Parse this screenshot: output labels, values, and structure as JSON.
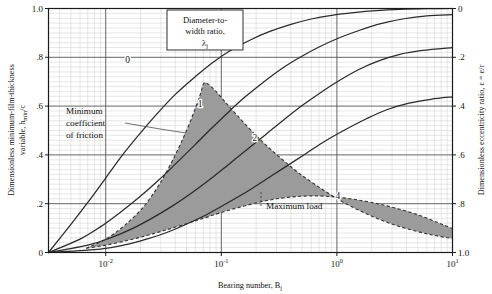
{
  "chart_data": {
    "type": "line",
    "title": "",
    "xlabel": "Bearing number, B",
    "xlabel_sub": "j",
    "ylabel_left_line1": "Dimensionless minimum-film-thickness",
    "ylabel_left_line2": "variable, h",
    "ylabel_left_sub": "min",
    "ylabel_left_tail": "/c",
    "ylabel_right": "Dimensionless eccentricity ratio, ε = e/r",
    "xscale": "log",
    "xlim": [
      0.0032,
      10
    ],
    "ylim": [
      0,
      1
    ],
    "grid": true,
    "x_tick_labels": [
      "10",
      "10",
      "10",
      "10"
    ],
    "x_tick_exponents": [
      "-2",
      "-1",
      "0",
      "1"
    ],
    "x_tick_values": [
      0.01,
      0.1,
      1,
      10
    ],
    "y_tick_labels_left": [
      "1.0",
      ".8",
      ".6",
      ".4",
      ".2",
      "0"
    ],
    "y_tick_values_left": [
      1.0,
      0.8,
      0.6,
      0.4,
      0.2,
      0.0
    ],
    "y_tick_labels_right": [
      "0",
      ".2",
      ".4",
      ".6",
      ".8",
      "1.0"
    ],
    "y_tick_values_right": [
      0.0,
      0.2,
      0.4,
      0.6,
      0.8,
      1.0
    ],
    "legend_title_line1": "Diameter-to-",
    "legend_title_line2": "width ratio,",
    "legend_title_symbol": "λ",
    "legend_title_symbol_sub": "j",
    "series": [
      {
        "name": "0",
        "label": "0",
        "label_x": 0.0155,
        "label_y": 0.775,
        "points": [
          [
            0.0032,
            0.0
          ],
          [
            0.005,
            0.115
          ],
          [
            0.007,
            0.205
          ],
          [
            0.01,
            0.305
          ],
          [
            0.014,
            0.4
          ],
          [
            0.02,
            0.49
          ],
          [
            0.028,
            0.57
          ],
          [
            0.04,
            0.648
          ],
          [
            0.06,
            0.722
          ],
          [
            0.085,
            0.78
          ],
          [
            0.12,
            0.828
          ],
          [
            0.18,
            0.872
          ],
          [
            0.26,
            0.905
          ],
          [
            0.4,
            0.935
          ],
          [
            0.6,
            0.957
          ],
          [
            0.9,
            0.972
          ],
          [
            1.4,
            0.983
          ],
          [
            2.2,
            0.991
          ],
          [
            3.5,
            0.996
          ],
          [
            6.0,
            0.999
          ],
          [
            10,
            1.0
          ]
        ]
      },
      {
        "name": "1",
        "label": "1",
        "label_x": 0.0655,
        "label_y": 0.597,
        "points": [
          [
            0.0032,
            0.0
          ],
          [
            0.006,
            0.055
          ],
          [
            0.009,
            0.105
          ],
          [
            0.013,
            0.16
          ],
          [
            0.019,
            0.222
          ],
          [
            0.028,
            0.292
          ],
          [
            0.04,
            0.362
          ],
          [
            0.058,
            0.437
          ],
          [
            0.082,
            0.508
          ],
          [
            0.115,
            0.575
          ],
          [
            0.16,
            0.637
          ],
          [
            0.23,
            0.697
          ],
          [
            0.33,
            0.752
          ],
          [
            0.48,
            0.8
          ],
          [
            0.7,
            0.842
          ],
          [
            1.05,
            0.88
          ],
          [
            1.6,
            0.912
          ],
          [
            2.4,
            0.938
          ],
          [
            3.8,
            0.958
          ],
          [
            6.0,
            0.97
          ],
          [
            10,
            0.975
          ]
        ]
      },
      {
        "name": "2",
        "label": "2",
        "label_x": 0.195,
        "label_y": 0.455,
        "points": [
          [
            0.0032,
            0.0
          ],
          [
            0.007,
            0.03
          ],
          [
            0.011,
            0.06
          ],
          [
            0.017,
            0.098
          ],
          [
            0.025,
            0.14
          ],
          [
            0.037,
            0.188
          ],
          [
            0.055,
            0.243
          ],
          [
            0.08,
            0.3
          ],
          [
            0.115,
            0.36
          ],
          [
            0.165,
            0.42
          ],
          [
            0.24,
            0.482
          ],
          [
            0.35,
            0.545
          ],
          [
            0.5,
            0.602
          ],
          [
            0.72,
            0.655
          ],
          [
            1.05,
            0.705
          ],
          [
            1.55,
            0.75
          ],
          [
            2.3,
            0.785
          ],
          [
            3.5,
            0.812
          ],
          [
            5.5,
            0.828
          ],
          [
            10,
            0.84
          ]
        ]
      },
      {
        "name": "4",
        "label": "4",
        "label_x": 1.02,
        "label_y": 0.218,
        "points": [
          [
            0.0032,
            0.0
          ],
          [
            0.009,
            0.014
          ],
          [
            0.015,
            0.032
          ],
          [
            0.023,
            0.056
          ],
          [
            0.035,
            0.085
          ],
          [
            0.052,
            0.12
          ],
          [
            0.078,
            0.16
          ],
          [
            0.115,
            0.205
          ],
          [
            0.17,
            0.252
          ],
          [
            0.25,
            0.303
          ],
          [
            0.37,
            0.355
          ],
          [
            0.55,
            0.408
          ],
          [
            0.8,
            0.458
          ],
          [
            1.2,
            0.505
          ],
          [
            1.8,
            0.548
          ],
          [
            2.7,
            0.585
          ],
          [
            4.2,
            0.612
          ],
          [
            6.5,
            0.628
          ],
          [
            10,
            0.638
          ]
        ]
      }
    ],
    "shaded_region": {
      "name": "optimum-zone",
      "fill_color": "#9b9b9b",
      "border_style": "dashed",
      "upper_boundary": [
        [
          0.0068,
          0.0175
        ],
        [
          0.01,
          0.055
        ],
        [
          0.0145,
          0.11
        ],
        [
          0.0215,
          0.19
        ],
        [
          0.03,
          0.29
        ],
        [
          0.04,
          0.4
        ],
        [
          0.05,
          0.5
        ],
        [
          0.059,
          0.585
        ],
        [
          0.066,
          0.65
        ],
        [
          0.0705,
          0.693
        ],
        [
          0.077,
          0.69
        ],
        [
          0.09,
          0.66
        ],
        [
          0.108,
          0.617
        ],
        [
          0.135,
          0.565
        ],
        [
          0.175,
          0.508
        ],
        [
          0.235,
          0.447
        ],
        [
          0.33,
          0.385
        ],
        [
          0.47,
          0.325
        ],
        [
          0.7,
          0.268
        ],
        [
          1.05,
          0.215
        ],
        [
          1.6,
          0.17
        ],
        [
          2.5,
          0.13
        ],
        [
          4.0,
          0.098
        ],
        [
          6.5,
          0.073
        ],
        [
          10,
          0.057
        ]
      ],
      "lower_boundary": [
        [
          0.0068,
          0.0175
        ],
        [
          0.01,
          0.03
        ],
        [
          0.015,
          0.048
        ],
        [
          0.022,
          0.068
        ],
        [
          0.032,
          0.09
        ],
        [
          0.047,
          0.114
        ],
        [
          0.07,
          0.14
        ],
        [
          0.1,
          0.164
        ],
        [
          0.145,
          0.186
        ],
        [
          0.21,
          0.205
        ],
        [
          0.3,
          0.22
        ],
        [
          0.44,
          0.229
        ],
        [
          0.64,
          0.232
        ],
        [
          0.95,
          0.228
        ],
        [
          1.4,
          0.218
        ],
        [
          2.1,
          0.203
        ],
        [
          3.2,
          0.182
        ],
        [
          5.0,
          0.155
        ],
        [
          7.5,
          0.122
        ],
        [
          10,
          0.098
        ]
      ]
    },
    "annotations": [
      {
        "name": "minimum-coefficient-of-friction",
        "line1": "Minimum",
        "line2": "coefficient",
        "line3": "of friction",
        "x": 65,
        "y": 108
      },
      {
        "name": "maximum-load",
        "text": "Maximum load",
        "x": 263,
        "y": 206
      }
    ]
  },
  "colors": {
    "curve": "#2a2a2a",
    "shade": "#9b9b9b",
    "shade_border": "#333333",
    "grid_minor": "#c9c9c9",
    "grid_major": "#555555",
    "frame": "#1a1a1a",
    "text": "#111111"
  }
}
